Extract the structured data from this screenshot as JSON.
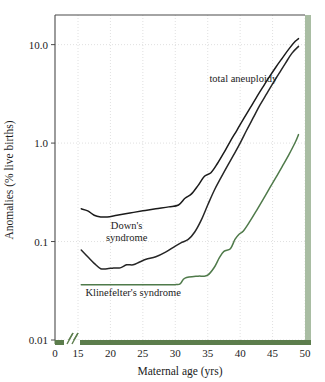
{
  "chart_data": {
    "type": "line",
    "title": "",
    "xlabel": "Maternal age (yrs)",
    "ylabel": "Anomalies (% live births)",
    "yscale": "log",
    "xlim": [
      0,
      50
    ],
    "ylim": [
      0.01,
      20
    ],
    "grid": true,
    "legend_position": "inline-annotations",
    "axis_break": "//",
    "xticks": [
      "0",
      "15",
      "20",
      "25",
      "30",
      "35",
      "40",
      "45",
      "50"
    ],
    "xtick_values": [
      0,
      15,
      20,
      25,
      30,
      35,
      40,
      45,
      50
    ],
    "yticks": [
      "10.0",
      "1.0",
      "0.1",
      "0.01"
    ],
    "ytick_values": [
      10.0,
      1.0,
      0.1,
      0.01
    ],
    "series": [
      {
        "name": "total aneuploidy",
        "color": "#1b1b1b",
        "label_x": 40.5,
        "label_y": 4.2,
        "x": [
          15.5,
          16.5,
          17.5,
          18.5,
          19.5,
          21,
          23,
          25,
          27,
          29,
          30.5,
          31.5,
          32.5,
          33.5,
          34.5,
          35.5,
          36.5,
          37.5,
          38.5,
          39.5,
          40.5,
          41.5,
          42.5,
          43.5,
          44.5,
          45.5,
          46.5,
          47.5,
          48.5,
          49
        ],
        "y": [
          0.215,
          0.205,
          0.185,
          0.178,
          0.178,
          0.185,
          0.195,
          0.205,
          0.215,
          0.225,
          0.235,
          0.275,
          0.305,
          0.37,
          0.46,
          0.5,
          0.62,
          0.8,
          1.05,
          1.35,
          1.75,
          2.25,
          2.9,
          3.7,
          4.7,
          5.9,
          7.3,
          9.0,
          10.8,
          11.5
        ]
      },
      {
        "name": "Down's syndrome",
        "color": "#262626",
        "label_x": 22.5,
        "label_y": 0.135,
        "x": [
          15.5,
          16.5,
          17.5,
          18.5,
          19.5,
          20.5,
          21.5,
          22.5,
          23.5,
          24.5,
          25.5,
          27,
          28.5,
          30,
          31,
          32,
          33,
          34,
          35,
          36,
          37,
          38,
          39,
          40,
          41,
          42,
          43,
          44,
          45,
          46,
          47,
          48,
          49
        ],
        "y": [
          0.082,
          0.07,
          0.06,
          0.053,
          0.053,
          0.054,
          0.054,
          0.058,
          0.058,
          0.062,
          0.066,
          0.07,
          0.078,
          0.09,
          0.098,
          0.105,
          0.125,
          0.165,
          0.235,
          0.33,
          0.44,
          0.58,
          0.76,
          1.0,
          1.35,
          1.8,
          2.4,
          3.1,
          4.0,
          5.1,
          6.5,
          8.2,
          9.6
        ]
      },
      {
        "name": "Klinefelter's syndrome",
        "color": "#4f7a4a",
        "label_x": 23.5,
        "label_y": 0.028,
        "x": [
          15.5,
          20,
          25,
          30,
          30.8,
          31.5,
          33.5,
          34.2,
          35,
          36,
          36.8,
          37.5,
          38.5,
          39.2,
          39.8,
          40.5,
          41.5,
          42.5,
          43.5,
          44.5,
          45.5,
          46.5,
          47.5,
          48.5,
          49
        ],
        "y": [
          0.0365,
          0.0365,
          0.0365,
          0.0365,
          0.0375,
          0.0425,
          0.0445,
          0.0445,
          0.0455,
          0.0545,
          0.0685,
          0.0795,
          0.0845,
          0.105,
          0.118,
          0.128,
          0.16,
          0.205,
          0.265,
          0.345,
          0.445,
          0.58,
          0.76,
          1.02,
          1.22
        ]
      }
    ]
  },
  "colors": {
    "axis_green": "#5c7d4c",
    "bar_sage": "#a9bda3",
    "grid": "#d8d8d8",
    "frame": "#4a4a4a",
    "curve_dark": "#1b1b1b",
    "curve_green": "#4f7a4a",
    "background": "#ffffff"
  }
}
